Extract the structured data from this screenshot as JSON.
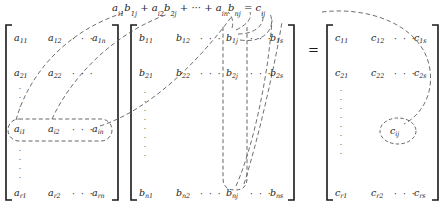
{
  "figure": {
    "kind": "matrix-multiplication-diagram",
    "equation": {
      "terms": [
        "a_{i1}b_{1j}",
        "a_{i2}b_{2j}",
        "a_{in}b_{nj}"
      ],
      "plus": "+",
      "ellipsis": "···",
      "equals": "=",
      "result": "c_{ij}",
      "parts": [
        {
          "base": "a",
          "sub": "i1"
        },
        {
          "base": "b",
          "sub": "1j"
        },
        {
          "base": "a",
          "sub": "i2"
        },
        {
          "base": "b",
          "sub": "2j"
        },
        {
          "base": "a",
          "sub": "in"
        },
        {
          "base": "b",
          "sub": "nj"
        },
        {
          "base": "c",
          "sub": "ij"
        }
      ]
    },
    "equals_sign": "=",
    "hdots": "·  ·  ·",
    "vdots": "·",
    "matrices": [
      {
        "name": "A",
        "rows": [
          [
            {
              "base": "a",
              "sub": "11"
            },
            {
              "base": "a",
              "sub": "12"
            },
            {
              "dots": true
            },
            {
              "base": "a",
              "sub": "1n"
            }
          ],
          [
            {
              "base": "a",
              "sub": "21"
            },
            {
              "base": "a",
              "sub": "22"
            },
            {
              "dots": true
            },
            {
              "base": "a",
              "sub": "2n"
            }
          ],
          [
            {
              "base": "a",
              "sub": "i1"
            },
            {
              "base": "a",
              "sub": "i2"
            },
            {
              "dots": true
            },
            {
              "base": "a",
              "sub": "in"
            }
          ],
          [
            {
              "base": "a",
              "sub": "r1"
            },
            {
              "base": "a",
              "sub": "r2"
            },
            {
              "dots": true
            },
            {
              "base": "a",
              "sub": "rn"
            }
          ]
        ],
        "highlight": "row-i"
      },
      {
        "name": "B",
        "rows": [
          [
            {
              "base": "b",
              "sub": "11"
            },
            {
              "base": "b",
              "sub": "12"
            },
            {
              "dots": true
            },
            {
              "base": "b",
              "sub": "1j"
            },
            {
              "dots": true
            },
            {
              "base": "b",
              "sub": "1s"
            }
          ],
          [
            {
              "base": "b",
              "sub": "21"
            },
            {
              "base": "b",
              "sub": "22"
            },
            {
              "dots": true
            },
            {
              "base": "b",
              "sub": "2j"
            },
            {
              "dots": true
            },
            {
              "base": "b",
              "sub": "2s"
            }
          ],
          [
            {
              "base": "b",
              "sub": "n1"
            },
            {
              "base": "b",
              "sub": "n2"
            },
            {
              "dots": true
            },
            {
              "base": "b",
              "sub": "nj"
            },
            {
              "dots": true
            },
            {
              "base": "b",
              "sub": "ns"
            }
          ]
        ],
        "highlight": "column-j"
      },
      {
        "name": "C",
        "rows": [
          [
            {
              "base": "c",
              "sub": "11"
            },
            {
              "base": "c",
              "sub": "12"
            },
            {
              "dots": true
            },
            {
              "base": "c",
              "sub": "1s"
            }
          ],
          [
            {
              "base": "c",
              "sub": "21"
            },
            {
              "base": "c",
              "sub": "22"
            },
            {
              "dots": true
            },
            {
              "base": "c",
              "sub": "2s"
            }
          ],
          [
            {
              "base": "c",
              "sub": "r1"
            },
            {
              "base": "c",
              "sub": "r2"
            },
            {
              "dots": true
            },
            {
              "base": "c",
              "sub": "rs"
            }
          ]
        ],
        "highlight": "element-cij",
        "highlighted_element": {
          "base": "c",
          "sub": "ij"
        }
      }
    ],
    "colors": {
      "ink": "#1a1a1a",
      "dash": "#555555",
      "background": "#ffffff"
    }
  }
}
